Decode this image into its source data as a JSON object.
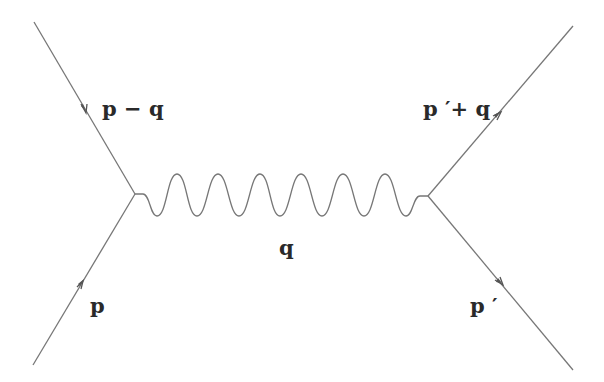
{
  "diagram": {
    "type": "feynman",
    "line_color": "#777777",
    "labels": {
      "incoming_left": "p",
      "outgoing_left": "p − q",
      "propagator": "q",
      "incoming_right": "p ′",
      "outgoing_right": "p ′+ q"
    }
  }
}
